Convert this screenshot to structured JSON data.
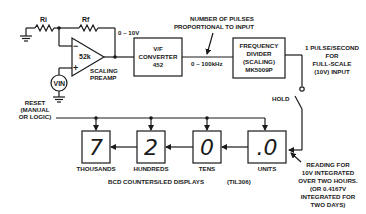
{
  "diagram": {
    "preamp": {
      "resistor_in": "Ri",
      "resistor_fb": "Rf",
      "gain_label": "52k",
      "label_line1": "SCALING",
      "label_line2": "PREAMP",
      "minus": "−",
      "plus": "+",
      "source": "VIN",
      "output_range": "0 – 10V"
    },
    "vf_converter": {
      "line1": "V/F",
      "line2": "CONVERTER",
      "line3": "452",
      "output_range": "0 – 100kHz"
    },
    "pulses_note": {
      "line1": "NUMBER OF PULSES",
      "line2": "PROPORTIONAL TO INPUT"
    },
    "frequency_divider": {
      "line1": "FREQUENCY",
      "line2": "DIVIDER",
      "line3": "(SCALING)",
      "line4": "MK5009P"
    },
    "output_note": {
      "line1": "1 PULSE/SECOND",
      "line2": "FOR",
      "line3": "FULL-SCALE",
      "line4": "(10V) INPUT"
    },
    "hold_label": "HOLD",
    "reset": {
      "line1": "RESET",
      "line2": "(MANUAL",
      "line3": "OR LOGIC)"
    },
    "counters": [
      {
        "digit": "7",
        "label": "THOUSANDS"
      },
      {
        "digit": "2",
        "label": "HUNDREDS"
      },
      {
        "digit": "0",
        "label": "TENS"
      },
      {
        "digit": ".0",
        "label": "UNITS"
      }
    ],
    "counters_caption": "BCD COUNTERS/LED DISPLAYS",
    "display_part": "(TIL306)",
    "reading_note": {
      "line1": "READING FOR",
      "line2": "10V INTEGRATED",
      "line3": "OVER TWO HOURS.",
      "line4": "(OR 0.4167V",
      "line5": "INTEGRATED FOR",
      "line6": "TWO DAYS)"
    }
  }
}
